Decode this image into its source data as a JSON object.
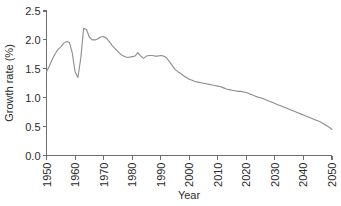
{
  "chart_data": {
    "type": "line",
    "title": "",
    "xlabel": "Year",
    "ylabel": "Growth rate (%)",
    "xlim": [
      1950,
      2050
    ],
    "ylim": [
      0.0,
      2.5
    ],
    "grid": false,
    "legend": null,
    "xticks": [
      "1950",
      "1960",
      "1970",
      "1980",
      "1990",
      "2000",
      "2010",
      "2020",
      "2030",
      "2040",
      "2050"
    ],
    "xtick_values": [
      1950,
      1960,
      1970,
      1980,
      1990,
      2000,
      2010,
      2020,
      2030,
      2040,
      2050
    ],
    "yticks": [
      "0.0",
      "0.5",
      "1.0",
      "1.5",
      "2.0",
      "2.5"
    ],
    "ytick_values": [
      0.0,
      0.5,
      1.0,
      1.5,
      2.0,
      2.5
    ],
    "series": [
      {
        "name": "World population growth rate",
        "color": "#8c8c8c",
        "x": [
          1950,
          1951,
          1952,
          1953,
          1954,
          1955,
          1956,
          1957,
          1958,
          1959,
          1960,
          1961,
          1962,
          1963,
          1964,
          1965,
          1966,
          1967,
          1968,
          1969,
          1970,
          1971,
          1972,
          1973,
          1974,
          1975,
          1976,
          1977,
          1978,
          1979,
          1980,
          1981,
          1982,
          1983,
          1984,
          1985,
          1986,
          1987,
          1988,
          1989,
          1990,
          1991,
          1992,
          1993,
          1994,
          1995,
          1996,
          1997,
          1998,
          1999,
          2000,
          2001,
          2002,
          2003,
          2004,
          2005,
          2006,
          2007,
          2008,
          2009,
          2010,
          2011,
          2012,
          2013,
          2014,
          2015,
          2016,
          2017,
          2018,
          2019,
          2020,
          2021,
          2022,
          2023,
          2024,
          2025,
          2026,
          2027,
          2028,
          2029,
          2030,
          2031,
          2032,
          2033,
          2034,
          2035,
          2036,
          2037,
          2038,
          2039,
          2040,
          2041,
          2042,
          2043,
          2044,
          2045,
          2046,
          2047,
          2048,
          2049,
          2050
        ],
        "y": [
          1.45,
          1.55,
          1.66,
          1.76,
          1.83,
          1.88,
          1.94,
          1.97,
          1.96,
          1.78,
          1.45,
          1.35,
          1.68,
          2.2,
          2.18,
          2.05,
          2.0,
          2.0,
          2.02,
          2.05,
          2.06,
          2.03,
          1.97,
          1.9,
          1.85,
          1.8,
          1.75,
          1.72,
          1.7,
          1.7,
          1.71,
          1.72,
          1.78,
          1.72,
          1.68,
          1.72,
          1.73,
          1.73,
          1.72,
          1.72,
          1.73,
          1.72,
          1.69,
          1.63,
          1.56,
          1.49,
          1.45,
          1.42,
          1.38,
          1.35,
          1.32,
          1.3,
          1.28,
          1.27,
          1.26,
          1.25,
          1.24,
          1.23,
          1.22,
          1.21,
          1.2,
          1.19,
          1.17,
          1.15,
          1.14,
          1.13,
          1.12,
          1.11,
          1.11,
          1.1,
          1.09,
          1.07,
          1.05,
          1.03,
          1.01,
          1.0,
          0.98,
          0.96,
          0.94,
          0.92,
          0.9,
          0.88,
          0.86,
          0.84,
          0.82,
          0.8,
          0.78,
          0.76,
          0.74,
          0.72,
          0.7,
          0.68,
          0.66,
          0.64,
          0.62,
          0.6,
          0.58,
          0.55,
          0.52,
          0.49,
          0.45
        ]
      }
    ]
  }
}
